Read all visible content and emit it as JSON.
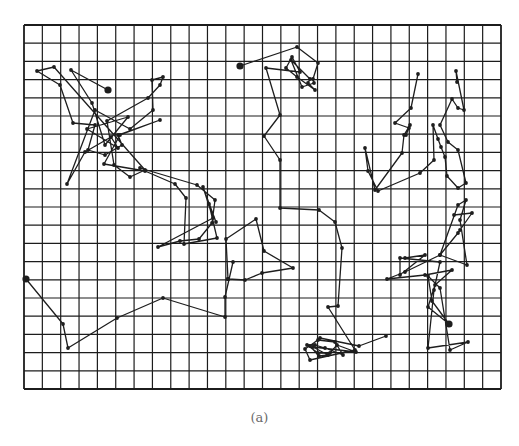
{
  "caption": "(a)",
  "grid": {
    "left": 24,
    "top": 25,
    "right": 501,
    "bottom": 389,
    "cols": 26,
    "rows": 20,
    "line_color": "#1c1c1c"
  },
  "path_color": "#1e1e1e",
  "walks": [
    {
      "name": "walk-top-left",
      "start_dot": [
        108,
        90
      ],
      "points": [
        [
          108,
          90
        ],
        [
          71,
          70
        ],
        [
          92,
          103
        ],
        [
          105,
          145
        ],
        [
          128,
          117
        ],
        [
          87,
          129
        ],
        [
          118,
          148
        ],
        [
          111,
          137
        ],
        [
          85,
          152
        ],
        [
          67,
          184
        ],
        [
          95,
          110
        ],
        [
          130,
          129
        ],
        [
          153,
          110
        ],
        [
          152,
          80
        ],
        [
          163,
          77
        ],
        [
          160,
          85
        ],
        [
          148,
          98
        ],
        [
          107,
          121
        ],
        [
          114,
          165
        ],
        [
          130,
          177
        ],
        [
          145,
          170
        ],
        [
          54,
          67
        ],
        [
          37,
          71
        ],
        [
          60,
          85
        ],
        [
          73,
          123
        ],
        [
          95,
          125
        ],
        [
          88,
          150
        ],
        [
          105,
          155
        ],
        [
          122,
          145
        ],
        [
          118,
          135
        ],
        [
          160,
          120
        ],
        [
          120,
          135
        ],
        [
          104,
          164
        ],
        [
          145,
          171
        ],
        [
          175,
          184
        ],
        [
          186,
          198
        ],
        [
          184,
          244
        ],
        [
          217,
          238
        ],
        [
          209,
          204
        ],
        [
          216,
          222
        ],
        [
          203,
          187
        ],
        [
          213,
          218
        ],
        [
          158,
          247
        ],
        [
          180,
          241
        ],
        [
          199,
          239
        ],
        [
          212,
          223
        ],
        [
          215,
          200
        ],
        [
          197,
          185
        ],
        [
          140,
          168
        ]
      ]
    },
    {
      "name": "walk-top-center",
      "start_dot": [
        240,
        66
      ],
      "points": [
        [
          240,
          66
        ],
        [
          297,
          47
        ],
        [
          318,
          63
        ],
        [
          313,
          79
        ],
        [
          314,
          83
        ],
        [
          302,
          87
        ],
        [
          291,
          60
        ],
        [
          310,
          79
        ],
        [
          308,
          83
        ],
        [
          315,
          90
        ],
        [
          297,
          77
        ],
        [
          286,
          68
        ],
        [
          292,
          57
        ],
        [
          300,
          72
        ],
        [
          266,
          68
        ],
        [
          280,
          115
        ],
        [
          264,
          136
        ],
        [
          280,
          160
        ],
        [
          280,
          208
        ],
        [
          319,
          210
        ],
        [
          335,
          222
        ],
        [
          342,
          248
        ],
        [
          338,
          306
        ],
        [
          328,
          307
        ],
        [
          355,
          350
        ],
        [
          310,
          360
        ],
        [
          305,
          349
        ],
        [
          318,
          340
        ],
        [
          335,
          342
        ],
        [
          343,
          355
        ],
        [
          325,
          348
        ],
        [
          315,
          345
        ],
        [
          307,
          345
        ],
        [
          318,
          353
        ],
        [
          330,
          353
        ],
        [
          337,
          345
        ],
        [
          356,
          352
        ],
        [
          313,
          347
        ],
        [
          328,
          355
        ],
        [
          319,
          356
        ],
        [
          310,
          346
        ],
        [
          320,
          338
        ],
        [
          359,
          346
        ],
        [
          386,
          336
        ]
      ]
    },
    {
      "name": "walk-center-loop",
      "start_dot": null,
      "points": [
        [
          228,
          279
        ],
        [
          226,
          239
        ],
        [
          256,
          219
        ],
        [
          264,
          251
        ],
        [
          293,
          268
        ],
        [
          262,
          273
        ],
        [
          245,
          280
        ],
        [
          228,
          279
        ],
        [
          228,
          279
        ]
      ]
    },
    {
      "name": "walk-bottom-left",
      "start_dot": [
        26,
        279
      ],
      "points": [
        [
          26,
          279
        ],
        [
          63,
          324
        ],
        [
          68,
          348
        ],
        [
          117,
          318
        ],
        [
          163,
          298
        ],
        [
          225,
          317
        ],
        [
          225,
          297
        ],
        [
          233,
          262
        ]
      ]
    },
    {
      "name": "walk-right-upper",
      "start_dot": null,
      "points": [
        [
          418,
          74
        ],
        [
          411,
          108
        ],
        [
          395,
          123
        ],
        [
          409,
          128
        ],
        [
          406,
          135
        ],
        [
          410,
          125
        ],
        [
          404,
          135
        ],
        [
          402,
          153
        ],
        [
          375,
          190
        ],
        [
          365,
          148
        ],
        [
          368,
          171
        ],
        [
          378,
          191
        ],
        [
          420,
          173
        ],
        [
          434,
          160
        ],
        [
          433,
          125
        ],
        [
          438,
          139
        ],
        [
          441,
          147
        ],
        [
          445,
          157
        ],
        [
          447,
          176
        ],
        [
          458,
          188
        ],
        [
          466,
          183
        ],
        [
          458,
          150
        ],
        [
          448,
          142
        ],
        [
          440,
          125
        ],
        [
          452,
          99
        ],
        [
          458,
          108
        ],
        [
          464,
          110
        ],
        [
          456,
          71
        ],
        [
          457,
          82
        ]
      ]
    },
    {
      "name": "walk-right-lower",
      "start_dot": [
        449,
        324
      ],
      "points": [
        [
          454,
          215
        ],
        [
          472,
          213
        ],
        [
          460,
          230
        ],
        [
          458,
          233
        ],
        [
          440,
          255
        ],
        [
          467,
          265
        ],
        [
          460,
          220
        ],
        [
          466,
          200
        ],
        [
          458,
          205
        ],
        [
          440,
          255
        ],
        [
          405,
          272
        ],
        [
          387,
          279
        ],
        [
          425,
          275
        ],
        [
          452,
          270
        ],
        [
          435,
          285
        ],
        [
          428,
          307
        ],
        [
          449,
          324
        ],
        [
          432,
          301
        ],
        [
          428,
          276
        ],
        [
          440,
          288
        ],
        [
          450,
          350
        ],
        [
          468,
          342
        ],
        [
          428,
          348
        ],
        [
          434,
          290
        ],
        [
          440,
          262
        ],
        [
          400,
          258
        ],
        [
          400,
          275
        ],
        [
          425,
          255
        ],
        [
          405,
          258
        ]
      ]
    }
  ]
}
